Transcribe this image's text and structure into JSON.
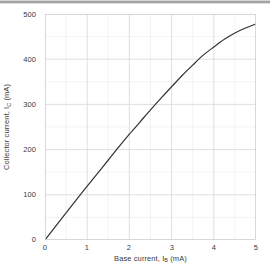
{
  "figure": {
    "background_color": "#ffffff",
    "top_bar_color": "#8e8e8e"
  },
  "axis": {
    "x_title_prefix": "Base current, ",
    "x_title_symbol": "I",
    "x_title_sub": "B",
    "x_title_unit": " (mA)",
    "x_title_full": "Base current, IB (mA)",
    "y_title_prefix": "Collector current, ",
    "y_title_symbol": "I",
    "y_title_sub": "C",
    "y_title_unit": " (mA)",
    "y_title_full": "Collector current, IC (mA)",
    "x_ticks": [
      "0",
      "1",
      "2",
      "3",
      "4",
      "5"
    ],
    "y_ticks": [
      "0",
      "100",
      "200",
      "300",
      "400",
      "500"
    ],
    "tick_color": "#3b3b3b",
    "frame_color": "#d0d0d0",
    "major_grid_color": "#d9d9d9",
    "minor_grid_color": "#eeeeee"
  },
  "chart_data": {
    "type": "line",
    "title": "",
    "xlabel": "Base current, IB (mA)",
    "ylabel": "Collector current, IC (mA)",
    "xlim": [
      0,
      5
    ],
    "ylim": [
      0,
      500
    ],
    "xticks": [
      0,
      1,
      2,
      3,
      4,
      5
    ],
    "yticks": [
      0,
      100,
      200,
      300,
      400,
      500
    ],
    "x_minor_step": 0.5,
    "y_minor_step": 50,
    "grid": true,
    "legend": null,
    "series": [
      {
        "name": "Collector current",
        "line_color": "#333333",
        "line_width": 1.2,
        "x": [
          0,
          0.25,
          0.5,
          0.75,
          1.0,
          1.25,
          1.5,
          1.75,
          2.0,
          2.25,
          2.5,
          2.75,
          3.0,
          3.25,
          3.5,
          3.75,
          4.0,
          4.25,
          4.5,
          4.75,
          5.0
        ],
        "y": [
          0,
          30,
          60,
          90,
          119,
          148,
          177,
          206,
          234,
          261,
          288,
          314,
          339,
          364,
          387,
          409,
          427,
          444,
          458,
          469,
          478
        ]
      }
    ]
  }
}
